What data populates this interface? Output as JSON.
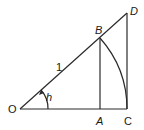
{
  "diagram": {
    "title": "",
    "points": {
      "O": {
        "label": "O",
        "x": 20,
        "y": 109
      },
      "A": {
        "label": "A",
        "x": 100,
        "y": 109
      },
      "C": {
        "label": "C",
        "x": 127,
        "y": 109
      },
      "B": {
        "label": "B",
        "x": 100,
        "y": 38
      },
      "D": {
        "label": "D",
        "x": 127,
        "y": 13
      }
    },
    "segment_labels": {
      "OB": "1"
    },
    "angle_label": "h",
    "stroke_color": "#2a2a2a",
    "background": "#ffffff"
  }
}
